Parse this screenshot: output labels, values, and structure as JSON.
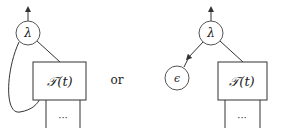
{
  "diagram": {
    "left": {
      "node_label": "λ",
      "box_label": "𝒯(t)",
      "continuation_label": "···"
    },
    "separator": "or",
    "right": {
      "node_label": "λ",
      "epsilon_label": "ϵ",
      "box_label": "𝒯(t)",
      "continuation_label": "···"
    },
    "colors": {
      "stroke": "#333333",
      "background": "#ffffff"
    }
  }
}
